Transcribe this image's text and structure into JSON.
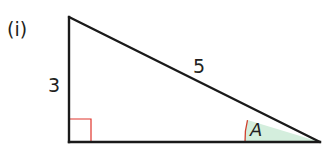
{
  "diagram": {
    "part_label": "(i)",
    "shape": "right-angled triangle",
    "sides": {
      "vertical_leg": "3",
      "hypotenuse": "5"
    },
    "angle_label": "A",
    "right_angle_marker": true,
    "colors": {
      "stroke": "#1a1a1a",
      "right_angle_marker": "#e0342c",
      "angle_arc": "#d0402e",
      "angle_fill": "#d4eedd"
    }
  }
}
